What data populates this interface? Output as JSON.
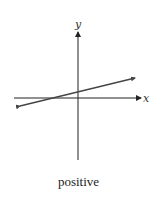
{
  "diagram": {
    "x_axis_label": "x",
    "y_axis_label": "y",
    "caption": "positive",
    "line": {
      "description": "line with positive slope",
      "slope_sign": "positive"
    },
    "colors": {
      "axes": "#222222",
      "line": "#444444"
    }
  }
}
